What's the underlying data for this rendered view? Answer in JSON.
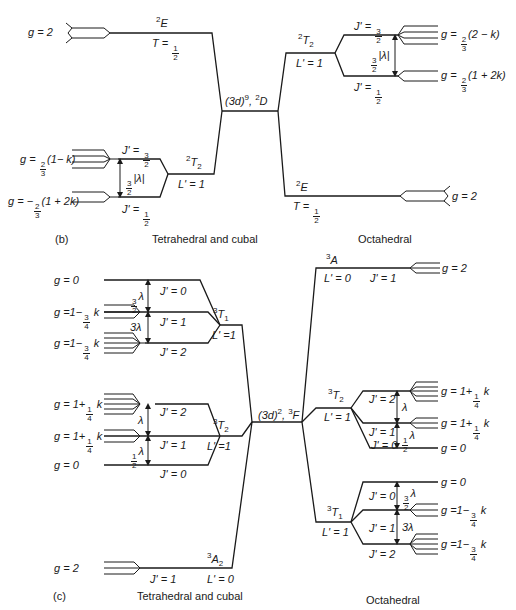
{
  "panel_b": {
    "caption": "(b)",
    "left_title": "Tetrahedral and cubal",
    "right_title": "Octahedral",
    "center": {
      "config": "(3d)",
      "exp": "9",
      "term": "D",
      "mult": "2"
    },
    "left": {
      "upper_state": {
        "term": "E",
        "mult": "2",
        "t_label": "T = ",
        "t_num": "1",
        "t_den": "2",
        "g": "g = 2"
      },
      "lower_state": {
        "term": "T",
        "mult": "2",
        "sub": "2",
        "l_label": "L' = 1",
        "levels": [
          {
            "j_label": "J' = ",
            "j_num": "3",
            "j_den": "2",
            "g_prefix": "g = ",
            "g_num": "2",
            "g_den": "3",
            "g_suffix": "(1− k)"
          },
          {
            "j_label": "J' = ",
            "j_num": "1",
            "j_den": "2",
            "g_prefix": "g = −",
            "g_num": "2",
            "g_den": "3",
            "g_suffix": "(1 + 2k)"
          }
        ],
        "splitting": {
          "num": "3",
          "den": "2",
          "text": "|λ|"
        }
      }
    },
    "right": {
      "upper_state": {
        "term": "T",
        "mult": "2",
        "sub": "2",
        "l_label": "L' = 1",
        "levels": [
          {
            "j_label": "J' = ",
            "j_num": "3",
            "j_den": "2",
            "g_prefix": "g = ",
            "g_num": "2",
            "g_den": "3",
            "g_suffix": "(2 − k)"
          },
          {
            "j_label": "J' = ",
            "j_num": "1",
            "j_den": "2",
            "g_prefix": "g = ",
            "g_num": "2",
            "g_den": "3",
            "g_suffix": "(1 + 2k)"
          }
        ],
        "splitting": {
          "num": "3",
          "den": "2",
          "text": "|λ|"
        }
      },
      "lower_state": {
        "term": "E",
        "mult": "2",
        "t_label": "T = ",
        "t_num": "1",
        "t_den": "2",
        "g": "g = 2"
      }
    }
  },
  "panel_c": {
    "caption": "(c)",
    "left_title": "Tetrahedral and cubal",
    "right_title": "Octahedral",
    "center": {
      "config": "(3d)",
      "exp": "2",
      "term": "F",
      "mult": "3"
    },
    "left": {
      "t1": {
        "term": "T",
        "mult": "3",
        "sub": "1",
        "l_label": "L' =1",
        "levels": [
          {
            "j": "J' = 0",
            "g": "g = 0"
          },
          {
            "j": "J' = 1",
            "g_prefix": "g =1−",
            "g_num": "3",
            "g_den": "4",
            "g_suffix": " k"
          },
          {
            "j": "J' = 2",
            "g_prefix": "g =1−",
            "g_num": "3",
            "g_den": "4",
            "g_suffix": " k"
          }
        ],
        "split_upper": {
          "num": "3",
          "den": "2",
          "text": "λ"
        },
        "split_lower": {
          "text": "3λ"
        }
      },
      "t2": {
        "term": "T",
        "mult": "3",
        "sub": "2",
        "l_label": "L' =1",
        "levels": [
          {
            "j": "J' = 2",
            "g_prefix": "g = 1+",
            "g_num": "1",
            "g_den": "4",
            "g_suffix": " k"
          },
          {
            "j": "J' = 1",
            "g_prefix": "g = 1+",
            "g_num": "1",
            "g_den": "4",
            "g_suffix": " k"
          },
          {
            "j": "J' = 0",
            "g": "g = 0"
          }
        ],
        "split_upper": {
          "text": "λ"
        },
        "split_lower": {
          "num": "1",
          "den": "2",
          "text": "λ"
        }
      },
      "a2": {
        "term": "A",
        "mult": "3",
        "sub": "2",
        "l_label": "L' = 0",
        "j": "J' = 1",
        "g": "g = 2"
      }
    },
    "right": {
      "a": {
        "term": "A",
        "mult": "3",
        "l_label": "L' = 0",
        "j": "J' = 1",
        "g": "g = 2"
      },
      "t2": {
        "term": "T",
        "mult": "3",
        "sub": "2",
        "l_label": "L' = 1",
        "levels": [
          {
            "j": "J' = 2",
            "g_prefix": "g = 1+",
            "g_num": "1",
            "g_den": "4",
            "g_suffix": " k"
          },
          {
            "j": "J' = 1",
            "g_prefix": "g = 1+",
            "g_num": "1",
            "g_den": "4",
            "g_suffix": " k"
          },
          {
            "j": "J' = 0",
            "g": "g = 0"
          }
        ],
        "split_upper": {
          "text": "λ"
        },
        "split_lower": {
          "num": "1",
          "den": "2",
          "text": "λ"
        }
      },
      "t1": {
        "term": "T",
        "mult": "3",
        "sub": "1",
        "l_label": "L' = 1",
        "levels": [
          {
            "j": "J' = 0",
            "g": "g = 0"
          },
          {
            "j": "J' = 1",
            "g_prefix": "g =1−",
            "g_num": "3",
            "g_den": "4",
            "g_suffix": " k"
          },
          {
            "j": "J' = 2",
            "g_prefix": "g =1−",
            "g_num": "3",
            "g_den": "4",
            "g_suffix": " k"
          }
        ],
        "split_upper": {
          "num": "3",
          "den": "2",
          "text": "λ"
        },
        "split_lower": {
          "text": "3λ"
        }
      }
    }
  }
}
